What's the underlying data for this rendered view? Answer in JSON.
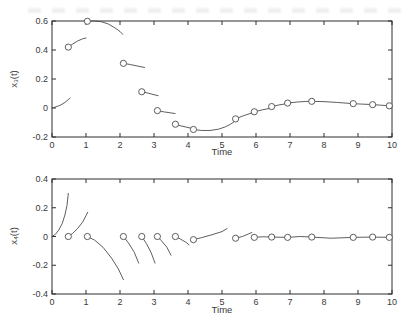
{
  "figure": {
    "background": "#ffffff",
    "line_color": "#4c4c4c",
    "axis_color": "#2e2e2e",
    "text_color": "#3a3a3a",
    "marker_fill": "#ffffff",
    "marker_symbol": "o"
  },
  "chart_data": [
    {
      "type": "line",
      "title": "",
      "xlabel": "Time",
      "ylabel": "x₃(t)",
      "xlim": [
        0,
        10
      ],
      "ylim": [
        -0.2,
        0.6
      ],
      "xticks": [
        "0",
        "1",
        "2",
        "3",
        "4",
        "5",
        "6",
        "7",
        "8",
        "9",
        "10"
      ],
      "yticks": [
        "-0.2",
        "0",
        "0.2",
        "0.4",
        "0.6"
      ],
      "grid": false,
      "box": true,
      "legend": null,
      "jump_times": [
        0.48,
        1.04,
        2.1,
        2.64,
        3.1,
        3.63,
        4.16,
        5.4,
        5.95,
        6.46,
        6.93,
        7.64,
        8.86,
        9.43,
        9.92
      ],
      "markers": [
        [
          0.48,
          0.42
        ],
        [
          1.04,
          0.598
        ],
        [
          2.1,
          0.308
        ],
        [
          2.64,
          0.112
        ],
        [
          3.1,
          -0.018
        ],
        [
          3.63,
          -0.112
        ],
        [
          4.16,
          -0.148
        ],
        [
          5.4,
          -0.075
        ],
        [
          5.95,
          -0.026
        ],
        [
          6.46,
          0.01
        ],
        [
          6.93,
          0.034
        ],
        [
          7.64,
          0.046
        ],
        [
          8.86,
          0.03
        ],
        [
          9.43,
          0.023
        ],
        [
          9.92,
          0.015
        ]
      ],
      "segments": [
        [
          [
            0,
            0
          ],
          [
            0.12,
            0.008
          ],
          [
            0.25,
            0.02
          ],
          [
            0.38,
            0.038
          ],
          [
            0.48,
            0.058
          ],
          [
            0.53,
            0.068
          ]
        ],
        [
          [
            0.48,
            0.42
          ],
          [
            0.6,
            0.44
          ],
          [
            0.75,
            0.462
          ],
          [
            0.9,
            0.477
          ],
          [
            1.0,
            0.483
          ]
        ],
        [
          [
            1.04,
            0.598
          ],
          [
            1.25,
            0.6
          ],
          [
            1.45,
            0.595
          ],
          [
            1.65,
            0.58
          ],
          [
            1.85,
            0.553
          ],
          [
            2.0,
            0.528
          ],
          [
            2.08,
            0.508
          ]
        ],
        [
          [
            2.1,
            0.308
          ],
          [
            2.3,
            0.3
          ],
          [
            2.5,
            0.29
          ],
          [
            2.65,
            0.283
          ],
          [
            2.72,
            0.28
          ]
        ],
        [
          [
            2.64,
            0.112
          ],
          [
            2.8,
            0.104
          ],
          [
            3.0,
            0.092
          ],
          [
            3.12,
            0.085
          ]
        ],
        [
          [
            3.1,
            -0.018
          ],
          [
            3.3,
            -0.027
          ],
          [
            3.5,
            -0.034
          ],
          [
            3.62,
            -0.038
          ]
        ],
        [
          [
            3.63,
            -0.112
          ],
          [
            3.8,
            -0.124
          ],
          [
            3.97,
            -0.133
          ],
          [
            4.1,
            -0.14
          ]
        ],
        [
          [
            4.16,
            -0.148
          ],
          [
            4.4,
            -0.155
          ],
          [
            4.65,
            -0.155
          ],
          [
            4.9,
            -0.146
          ],
          [
            5.1,
            -0.13
          ],
          [
            5.25,
            -0.112
          ],
          [
            5.35,
            -0.096
          ]
        ],
        [
          [
            5.4,
            -0.075
          ],
          [
            5.6,
            -0.056
          ],
          [
            5.8,
            -0.04
          ],
          [
            5.9,
            -0.033
          ]
        ],
        [
          [
            5.95,
            -0.026
          ],
          [
            6.2,
            -0.012
          ],
          [
            6.42,
            -0.002
          ]
        ],
        [
          [
            6.46,
            0.01
          ],
          [
            6.65,
            0.02
          ],
          [
            6.85,
            0.028
          ],
          [
            6.9,
            0.03
          ]
        ],
        [
          [
            6.93,
            0.034
          ],
          [
            7.2,
            0.041
          ],
          [
            7.45,
            0.045
          ],
          [
            7.62,
            0.046
          ]
        ],
        [
          [
            7.64,
            0.046
          ],
          [
            8.0,
            0.044
          ],
          [
            8.4,
            0.038
          ],
          [
            8.8,
            0.031
          ]
        ],
        [
          [
            8.86,
            0.03
          ],
          [
            9.1,
            0.027
          ],
          [
            9.4,
            0.024
          ]
        ],
        [
          [
            9.43,
            0.023
          ],
          [
            9.7,
            0.019
          ],
          [
            9.88,
            0.016
          ]
        ],
        [
          [
            9.92,
            0.015
          ],
          [
            10,
            0.014
          ]
        ]
      ]
    },
    {
      "type": "line",
      "title": "",
      "xlabel": "Time",
      "ylabel": "x₄(t)",
      "xlim": [
        0,
        10
      ],
      "ylim": [
        -0.4,
        0.4
      ],
      "xticks": [
        "0",
        "1",
        "2",
        "3",
        "4",
        "5",
        "6",
        "7",
        "8",
        "9",
        "10"
      ],
      "yticks": [
        "-0.4",
        "-0.2",
        "0",
        "0.2",
        "0.4"
      ],
      "grid": false,
      "box": true,
      "legend": null,
      "jump_times": [
        0.48,
        1.04,
        2.1,
        2.64,
        3.1,
        3.63,
        4.16,
        5.4,
        5.95,
        6.46,
        6.93,
        7.64,
        8.86,
        9.43,
        9.92
      ],
      "markers": [
        [
          0.48,
          0
        ],
        [
          1.04,
          0
        ],
        [
          2.1,
          0
        ],
        [
          2.64,
          0
        ],
        [
          3.1,
          0
        ],
        [
          3.63,
          0
        ],
        [
          4.16,
          -0.022
        ],
        [
          5.4,
          -0.012
        ],
        [
          5.95,
          -0.006
        ],
        [
          6.46,
          -0.004
        ],
        [
          6.93,
          -0.006
        ],
        [
          7.64,
          -0.004
        ],
        [
          8.86,
          -0.006
        ],
        [
          9.43,
          -0.004
        ],
        [
          9.92,
          -0.006
        ]
      ],
      "segments": [
        [
          [
            0,
            0
          ],
          [
            0.1,
            0.015
          ],
          [
            0.2,
            0.045
          ],
          [
            0.3,
            0.09
          ],
          [
            0.38,
            0.15
          ],
          [
            0.44,
            0.215
          ],
          [
            0.48,
            0.3
          ]
        ],
        [
          [
            0.48,
            0
          ],
          [
            0.6,
            0.02
          ],
          [
            0.75,
            0.055
          ],
          [
            0.9,
            0.1
          ],
          [
            1.0,
            0.145
          ],
          [
            1.05,
            0.168
          ]
        ],
        [
          [
            1.04,
            0
          ],
          [
            1.25,
            -0.025
          ],
          [
            1.5,
            -0.075
          ],
          [
            1.75,
            -0.15
          ],
          [
            1.95,
            -0.225
          ],
          [
            2.1,
            -0.3
          ]
        ],
        [
          [
            2.1,
            0
          ],
          [
            2.25,
            -0.045
          ],
          [
            2.42,
            -0.11
          ],
          [
            2.55,
            -0.185
          ]
        ],
        [
          [
            2.64,
            0
          ],
          [
            2.78,
            -0.05
          ],
          [
            2.92,
            -0.115
          ],
          [
            3.03,
            -0.185
          ]
        ],
        [
          [
            3.1,
            0
          ],
          [
            3.22,
            -0.03
          ],
          [
            3.38,
            -0.075
          ],
          [
            3.5,
            -0.13
          ]
        ],
        [
          [
            3.63,
            0
          ],
          [
            3.78,
            -0.018
          ],
          [
            3.95,
            -0.042
          ],
          [
            4.03,
            -0.058
          ]
        ],
        [
          [
            4.16,
            -0.022
          ],
          [
            4.4,
            -0.008
          ],
          [
            4.7,
            0.012
          ],
          [
            5.0,
            0.034
          ],
          [
            5.15,
            0.055
          ]
        ],
        [
          [
            5.4,
            -0.012
          ],
          [
            5.6,
            0.0
          ],
          [
            5.78,
            0.018
          ],
          [
            5.88,
            0.028
          ]
        ],
        [
          [
            5.95,
            -0.006
          ],
          [
            6.2,
            -0.002
          ],
          [
            6.46,
            -0.004
          ],
          [
            6.93,
            -0.006
          ],
          [
            7.3,
            0.0
          ],
          [
            7.64,
            -0.004
          ],
          [
            8.2,
            -0.012
          ],
          [
            8.86,
            -0.006
          ],
          [
            9.43,
            -0.004
          ],
          [
            9.92,
            -0.006
          ],
          [
            10,
            -0.006
          ]
        ]
      ]
    }
  ]
}
